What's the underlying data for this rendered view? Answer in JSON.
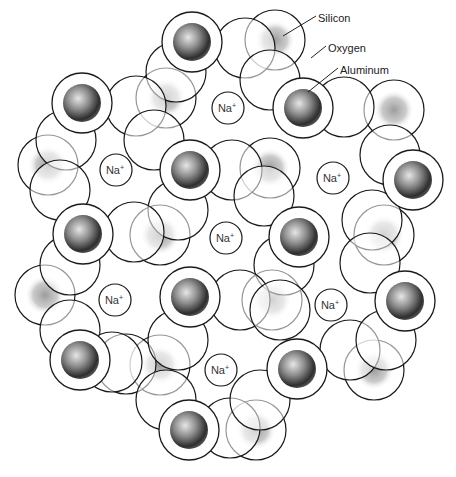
{
  "diagram": {
    "labels": [
      {
        "text": "Silicon",
        "x": 318,
        "y": 18,
        "lx1": 316,
        "ly1": 16,
        "lx2": 283,
        "ly2": 36
      },
      {
        "text": "Oxygen",
        "x": 328,
        "y": 48,
        "lx1": 326,
        "ly1": 46,
        "lx2": 311,
        "ly2": 58
      },
      {
        "text": "Aluminum",
        "x": 340,
        "y": 70,
        "lx1": 338,
        "ly1": 68,
        "lx2": 308,
        "ly2": 92
      }
    ],
    "sodium_label": "Na",
    "sodium_charge": "+",
    "sodium_ions": [
      {
        "x": 228,
        "y": 108
      },
      {
        "x": 116,
        "y": 170
      },
      {
        "x": 333,
        "y": 178
      },
      {
        "x": 226,
        "y": 238
      },
      {
        "x": 115,
        "y": 300
      },
      {
        "x": 331,
        "y": 305
      },
      {
        "x": 221,
        "y": 370
      }
    ],
    "back_spheres": [
      {
        "x": 275,
        "y": 40
      },
      {
        "x": 166,
        "y": 98
      },
      {
        "x": 394,
        "y": 110
      },
      {
        "x": 48,
        "y": 165
      },
      {
        "x": 270,
        "y": 168
      },
      {
        "x": 160,
        "y": 235
      },
      {
        "x": 384,
        "y": 235
      },
      {
        "x": 45,
        "y": 295
      },
      {
        "x": 272,
        "y": 300
      },
      {
        "x": 160,
        "y": 365
      },
      {
        "x": 374,
        "y": 370
      },
      {
        "x": 256,
        "y": 430
      }
    ],
    "oxygen_atoms": [
      {
        "x": 245,
        "y": 48
      },
      {
        "x": 176,
        "y": 72
      },
      {
        "x": 270,
        "y": 80
      },
      {
        "x": 136,
        "y": 106
      },
      {
        "x": 66,
        "y": 140
      },
      {
        "x": 232,
        "y": 170
      },
      {
        "x": 154,
        "y": 140
      },
      {
        "x": 344,
        "y": 107
      },
      {
        "x": 390,
        "y": 155
      },
      {
        "x": 264,
        "y": 196
      },
      {
        "x": 60,
        "y": 190
      },
      {
        "x": 178,
        "y": 210
      },
      {
        "x": 372,
        "y": 220
      },
      {
        "x": 134,
        "y": 232
      },
      {
        "x": 284,
        "y": 265
      },
      {
        "x": 70,
        "y": 265
      },
      {
        "x": 240,
        "y": 300
      },
      {
        "x": 370,
        "y": 263
      },
      {
        "x": 126,
        "y": 364
      },
      {
        "x": 178,
        "y": 340
      },
      {
        "x": 280,
        "y": 310
      },
      {
        "x": 350,
        "y": 350
      },
      {
        "x": 386,
        "y": 340
      },
      {
        "x": 70,
        "y": 330
      },
      {
        "x": 230,
        "y": 428
      },
      {
        "x": 166,
        "y": 400
      },
      {
        "x": 260,
        "y": 400
      },
      {
        "x": 112,
        "y": 362
      }
    ],
    "front_spheres": [
      {
        "x": 192,
        "y": 42,
        "type": "silicon"
      },
      {
        "x": 82,
        "y": 103,
        "type": "silicon"
      },
      {
        "x": 303,
        "y": 108,
        "type": "aluminum"
      },
      {
        "x": 190,
        "y": 170,
        "type": "silicon"
      },
      {
        "x": 413,
        "y": 180,
        "type": "silicon"
      },
      {
        "x": 83,
        "y": 234,
        "type": "silicon"
      },
      {
        "x": 299,
        "y": 237,
        "type": "silicon"
      },
      {
        "x": 190,
        "y": 297,
        "type": "silicon"
      },
      {
        "x": 405,
        "y": 301,
        "type": "silicon"
      },
      {
        "x": 80,
        "y": 360,
        "type": "silicon"
      },
      {
        "x": 297,
        "y": 369,
        "type": "aluminum"
      },
      {
        "x": 189,
        "y": 430,
        "type": "silicon"
      }
    ],
    "colors": {
      "outline": "#1a1a1a",
      "fill": "#ffffff",
      "shade_dark": "#3a3a3a",
      "shade_mid": "#8a8a8a",
      "shade_light": "#d8d8d8"
    }
  }
}
